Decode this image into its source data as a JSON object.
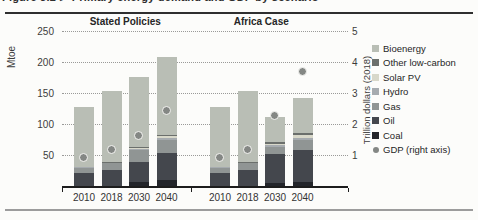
{
  "page": {
    "title_clipped": "Figure 3.2 ⊳ Primary energy demand and GDP by scenario"
  },
  "chart_data": {
    "type": "bar",
    "subtype": "stacked-bars-with-point-series",
    "unit": "Mtoe",
    "left_axis": {
      "label": "Mtoe",
      "ticks": [
        50,
        100,
        150,
        200,
        250
      ],
      "min": 0,
      "max": 250
    },
    "right_axis": {
      "label": "Trillion dollars (2018)",
      "ticks": [
        1,
        2,
        3,
        4,
        5
      ],
      "min": 0,
      "max": 5
    },
    "categories": [
      "2010",
      "2018",
      "2030",
      "2040"
    ],
    "stack_order_bottom_to_top": [
      "Coal",
      "Oil",
      "Gas",
      "Hydro",
      "Solar PV",
      "Other low-carbon",
      "Bioenergy"
    ],
    "groups": [
      {
        "label": "Stated Policies",
        "totals": [
          129,
          155,
          178,
          210
        ],
        "stacks": [
          [
            1,
            21,
            10,
            1,
            0,
            0,
            96
          ],
          [
            2,
            26,
            11,
            1,
            0.5,
            0.5,
            114
          ],
          [
            8,
            33,
            19,
            2,
            2,
            1,
            113
          ],
          [
            11,
            44,
            21,
            3,
            3,
            2,
            126
          ]
        ],
        "gdp_trillion_dollars": [
          0.95,
          1.2,
          1.65,
          2.45
        ]
      },
      {
        "label": "Africa Case",
        "totals": [
          129,
          155,
          113,
          144
        ],
        "stacks": [
          [
            1,
            21,
            10,
            1,
            0,
            0,
            96
          ],
          [
            2,
            26,
            11,
            1,
            0.5,
            0.5,
            114
          ],
          [
            7,
            46,
            12,
            2,
            3,
            2,
            41
          ],
          [
            8,
            51,
            17,
            3,
            5,
            3,
            57
          ]
        ],
        "gdp_trillion_dollars": [
          0.95,
          1.2,
          2.3,
          3.7
        ]
      }
    ],
    "legend": [
      {
        "label": "Bioenergy",
        "marker": "square",
        "color": "#b9beb5"
      },
      {
        "label": "Other low-carbon",
        "marker": "square",
        "color": "#6b6f6c"
      },
      {
        "label": "Solar PV",
        "marker": "square",
        "color": "#d8d8ca"
      },
      {
        "label": "Hydro",
        "marker": "square",
        "color": "#a6abaf"
      },
      {
        "label": "Gas",
        "marker": "square",
        "color": "#909594"
      },
      {
        "label": "Oil",
        "marker": "square",
        "color": "#44474d"
      },
      {
        "label": "Coal",
        "marker": "square",
        "color": "#23252a"
      },
      {
        "label": "GDP (right axis)",
        "marker": "circle",
        "color": "#848784"
      }
    ],
    "colors": {
      "Coal": "#23252a",
      "Oil": "#44474d",
      "Gas": "#909594",
      "Hydro": "#a6abaf",
      "Solar PV": "#d8d8ca",
      "Other low-carbon": "#6b6f6c",
      "Bioenergy": "#b9beb5",
      "GDP": "#848784"
    },
    "grid": "horizontal-dotted",
    "legend_position": "right"
  }
}
